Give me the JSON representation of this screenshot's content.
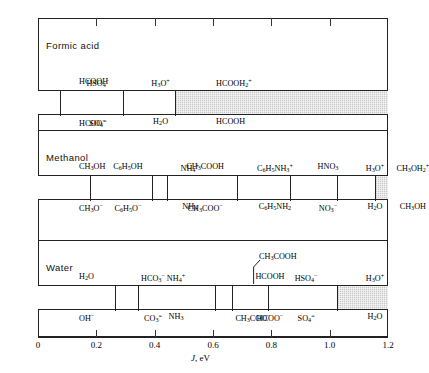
{
  "figure": {
    "axis": {
      "label": "J, eV",
      "label_italic": "J",
      "label_rest": ", eV",
      "min": 0,
      "max": 1.2,
      "ticks": [
        0,
        0.2,
        0.4,
        0.6,
        0.8,
        1.0,
        1.2
      ],
      "tick_labels": [
        "0",
        "0.2",
        "0.4",
        "0.6",
        "0.8",
        "1.0",
        "1.2"
      ]
    },
    "shade_color": "#c9c9c9",
    "line_color": "#222222",
    "panels": [
      {
        "title": "Formic acid",
        "shade_start": 0.47,
        "shade_end": 1.2,
        "species": [
          {
            "value": 0.0,
            "acid": "HCOOH",
            "acid_html": "HCOOH",
            "base": "HCOO−",
            "base_html": "HCOO<sup>−</sup>",
            "tick": false,
            "align": "left"
          },
          {
            "value": 0.075,
            "acid": "HSO4−",
            "acid_html": "HSO<sub>4</sub><sup>−</sup>",
            "base": "SO4=",
            "base_html": "SO<sub>4</sub><sup>=</sup>",
            "tick": true,
            "align": "center"
          },
          {
            "value": 0.29,
            "acid": "H3O+",
            "acid_html": "H<sub>3</sub>O<sup>+</sup>",
            "base": "H2O",
            "base_html": "H<sub>2</sub>O",
            "tick": true,
            "align": "center"
          },
          {
            "value": 0.47,
            "acid": "HCOOH2+",
            "acid_html": "HCOOH<sub>2</sub><sup>+</sup>",
            "base": "HCOOH",
            "base_html": "HCOOH",
            "tick": true,
            "align": "left"
          }
        ]
      },
      {
        "title": "Methanol",
        "shade_start": 1.155,
        "shade_end": 1.2,
        "species": [
          {
            "value": 0.0,
            "acid": "CH3OH",
            "acid_html": "CH<sub>3</sub>OH",
            "base": "CH3O−",
            "base_html": "CH<sub>3</sub>O<sup>−</sup>",
            "tick": false,
            "align": "left"
          },
          {
            "value": 0.178,
            "acid": "C6H5OH",
            "acid_html": "C<sub>6</sub>H<sub>5</sub>OH",
            "base": "C6H5O−",
            "base_html": "C<sub>6</sub>H<sub>5</sub>O<sup>−</sup>",
            "tick": true,
            "align": "center"
          },
          {
            "value": 0.39,
            "acid": "NH4+",
            "acid_html": "NH<sub>4</sub><sup>+</sup>",
            "base": "NH3",
            "base_html": "NH<sub>3</sub>",
            "tick": true,
            "align": "center"
          },
          {
            "value": 0.443,
            "acid": "CH3COOH",
            "acid_html": "CH<sub>3</sub>COOH",
            "base": "CH3COO−",
            "base_html": "CH<sub>3</sub>COO<sup>−</sup>",
            "tick": true,
            "align": "center"
          },
          {
            "value": 0.682,
            "acid": "C6H5NH3+",
            "acid_html": "C<sub>6</sub>H<sub>5</sub>NH<sub>3</sub><sup>+</sup>",
            "base": "C6H5NH2",
            "base_html": "C<sub>6</sub>H<sub>5</sub>NH<sub>2</sub>",
            "tick": true,
            "align": "center"
          },
          {
            "value": 0.864,
            "acid": "HNO3",
            "acid_html": "HNO<sub>3</sub>",
            "base": "NO3−",
            "base_html": "NO<sub>3</sub><sup>−</sup>",
            "tick": true,
            "align": "center"
          },
          {
            "value": 1.025,
            "acid": "H3O+",
            "acid_html": "H<sub>3</sub>O<sup>+</sup>",
            "base": "H2O",
            "base_html": "H<sub>2</sub>O",
            "tick": true,
            "align": "center"
          },
          {
            "value": 1.155,
            "acid": "CH3OH2+",
            "acid_html": "CH<sub>3</sub>OH<sub>2</sub><sup>+</sup>",
            "base": "CH3OH",
            "base_html": "CH<sub>3</sub>OH",
            "tick": true,
            "align": "center"
          }
        ]
      },
      {
        "title": "Water",
        "shade_start": 1.025,
        "shade_end": 1.2,
        "species": [
          {
            "value": 0.0,
            "acid": "H2O",
            "acid_html": "H<sub>2</sub>O",
            "base": "OH−",
            "base_html": "OH<sup>−</sup>",
            "tick": false,
            "align": "left"
          },
          {
            "value": 0.264,
            "acid": "HCO3−",
            "acid_html": "HCO<sub>3</sub><sup>−</sup>",
            "base": "CO3=",
            "base_html": "CO<sub>3</sub><sup>=</sup>",
            "tick": true,
            "align": "center"
          },
          {
            "value": 0.343,
            "acid": "NH4+",
            "acid_html": "NH<sub>4</sub><sup>+</sup>",
            "base": "NH3",
            "base_html": "NH<sub>3</sub>",
            "tick": true,
            "align": "center"
          },
          {
            "value": 0.607,
            "acid": "CH3COOH",
            "acid_html": "CH<sub>3</sub>COOH",
            "base": "CH3COO−",
            "base_html": "CH<sub>3</sub>COO<sup>−</sup>",
            "tick": true,
            "align": "center",
            "leader": true
          },
          {
            "value": 0.665,
            "acid": "HCOOH",
            "acid_html": "HCOOH",
            "base": "HCOO−",
            "base_html": "HCOO<sup>−</sup>",
            "tick": true,
            "align": "center"
          },
          {
            "value": 0.789,
            "acid": "HSO4−",
            "acid_html": "HSO<sub>4</sub><sup>−</sup>",
            "base": "SO4=",
            "base_html": "SO<sub>4</sub><sup>=</sup>",
            "tick": true,
            "align": "center"
          },
          {
            "value": 1.025,
            "acid": "H3O+",
            "acid_html": "H<sub>3</sub>O<sup>+</sup>",
            "base": "H2O",
            "base_html": "H<sub>2</sub>O",
            "tick": true,
            "align": "center"
          }
        ]
      }
    ]
  },
  "chart_data": {
    "type": "table",
    "xlabel": "J, eV",
    "ylabel": "",
    "xlim": [
      0,
      1.2
    ],
    "grid": false,
    "legend": "none",
    "panels": [
      {
        "solvent": "Formic acid",
        "levelling_region": [
          0.47,
          1.2
        ],
        "acids": [
          "HCOOH",
          "HSO4−",
          "H3O+",
          "HCOOH2+"
        ],
        "bases": [
          "HCOO−",
          "SO4=",
          "H2O",
          "HCOOH"
        ],
        "values": [
          0.0,
          0.075,
          0.29,
          0.47
        ]
      },
      {
        "solvent": "Methanol",
        "levelling_region": [
          1.155,
          1.2
        ],
        "acids": [
          "CH3OH",
          "C6H5OH",
          "NH4+",
          "CH3COOH",
          "C6H5NH3+",
          "HNO3",
          "H3O+",
          "CH3OH2+"
        ],
        "bases": [
          "CH3O−",
          "C6H5O−",
          "NH3",
          "CH3COO−",
          "C6H5NH2",
          "NO3−",
          "H2O",
          "CH3OH"
        ],
        "values": [
          0.0,
          0.178,
          0.39,
          0.443,
          0.682,
          0.864,
          1.025,
          1.155
        ]
      },
      {
        "solvent": "Water",
        "levelling_region": [
          1.025,
          1.2
        ],
        "acids": [
          "H2O",
          "HCO3−",
          "NH4+",
          "CH3COOH",
          "HCOOH",
          "HSO4−",
          "H3O+"
        ],
        "bases": [
          "OH−",
          "CO3=",
          "NH3",
          "CH3COO−",
          "HCOO−",
          "SO4=",
          "H2O"
        ],
        "values": [
          0.0,
          0.264,
          0.343,
          0.607,
          0.665,
          0.789,
          1.025
        ]
      }
    ]
  }
}
